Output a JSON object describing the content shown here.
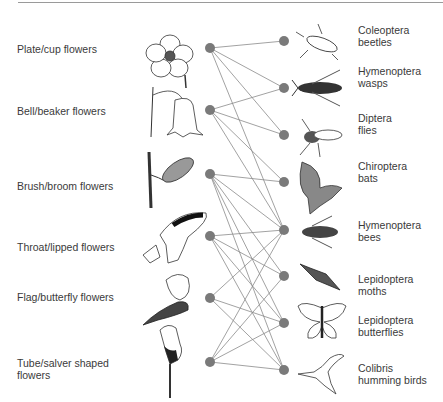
{
  "diagram": {
    "type": "bipartite-network",
    "node_color": "#7a7a7a",
    "edge_color": "#8a8a8a",
    "flowers": [
      {
        "id": "plate",
        "label": "Plate/cup flowers",
        "y": 48
      },
      {
        "id": "bell",
        "label": "Bell/beaker flowers",
        "y": 110
      },
      {
        "id": "brush",
        "label": "Brush/broom flowers",
        "y": 174
      },
      {
        "id": "throat",
        "label": "Throat/lipped flowers",
        "y": 236
      },
      {
        "id": "flag",
        "label": "Flag/butterfly flowers",
        "y": 298
      },
      {
        "id": "tube",
        "label": "Tube/salver shaped flowers",
        "label_line1": "Tube/salver shaped",
        "label_line2": "flowers",
        "y": 362
      }
    ],
    "pollinators": [
      {
        "id": "beetles",
        "line1": "Coleoptera",
        "line2": "beetles",
        "y": 41
      },
      {
        "id": "wasps",
        "line1": "Hymenoptera",
        "line2": "wasps",
        "y": 88
      },
      {
        "id": "flies",
        "line1": "Diptera",
        "line2": "flies",
        "y": 135
      },
      {
        "id": "bats",
        "line1": "Chiroptera",
        "line2": "bats",
        "y": 182
      },
      {
        "id": "bees",
        "line1": "Hymenoptera",
        "line2": "bees",
        "y": 230
      },
      {
        "id": "moths",
        "line1": "Lepidoptera",
        "line2": "moths",
        "y": 276
      },
      {
        "id": "butterflies",
        "line1": "Lepidoptera",
        "line2": "butterflies",
        "y": 323
      },
      {
        "id": "hummingbirds",
        "line1": "Colibris",
        "line2": "humming birds",
        "y": 370
      }
    ],
    "edges": [
      [
        "plate",
        "beetles"
      ],
      [
        "plate",
        "wasps"
      ],
      [
        "plate",
        "flies"
      ],
      [
        "plate",
        "bees"
      ],
      [
        "bell",
        "wasps"
      ],
      [
        "bell",
        "flies"
      ],
      [
        "bell",
        "bats"
      ],
      [
        "bell",
        "bees"
      ],
      [
        "brush",
        "bats"
      ],
      [
        "brush",
        "bees"
      ],
      [
        "brush",
        "moths"
      ],
      [
        "brush",
        "butterflies"
      ],
      [
        "brush",
        "hummingbirds"
      ],
      [
        "throat",
        "bees"
      ],
      [
        "throat",
        "moths"
      ],
      [
        "throat",
        "butterflies"
      ],
      [
        "throat",
        "hummingbirds"
      ],
      [
        "flag",
        "bees"
      ],
      [
        "flag",
        "butterflies"
      ],
      [
        "flag",
        "hummingbirds"
      ],
      [
        "tube",
        "bees"
      ],
      [
        "tube",
        "moths"
      ],
      [
        "tube",
        "butterflies"
      ],
      [
        "tube",
        "hummingbirds"
      ]
    ]
  }
}
